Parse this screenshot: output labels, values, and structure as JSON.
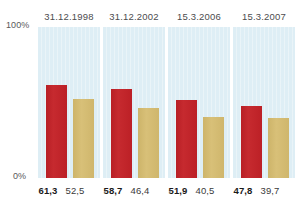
{
  "chart_data": {
    "type": "bar",
    "title": "",
    "subtitle": "",
    "xlabel": "",
    "ylabel": "",
    "ylim": [
      0,
      100
    ],
    "grid": false,
    "legend_position": "none",
    "axis_ticks": [
      "0%",
      "100%"
    ],
    "categories": [
      "31.12.1998",
      "31.12.2002",
      "15.3.2006",
      "15.3.2007"
    ],
    "series": [
      {
        "name": "primary",
        "color": "#c1272d",
        "values": [
          61.3,
          58.7,
          51.9,
          47.8
        ],
        "value_labels": [
          "61,3",
          "58,7",
          "51,9",
          "47,8"
        ]
      },
      {
        "name": "secondary",
        "color": "#d4bc72",
        "values": [
          52.5,
          46.4,
          40.5,
          39.7
        ],
        "value_labels": [
          "52,5",
          "46,4",
          "40,5",
          "39,7"
        ]
      }
    ],
    "panel_background": "#deeef5"
  },
  "axis": {
    "top_label": "100%",
    "bottom_label": "0%"
  },
  "groups": [
    {
      "date": "31.12.1998",
      "primary_value": "61,3",
      "secondary_value": "52,5",
      "primary_pct": 61.3,
      "secondary_pct": 52.5
    },
    {
      "date": "31.12.2002",
      "primary_value": "58,7",
      "secondary_value": "46,4",
      "primary_pct": 58.7,
      "secondary_pct": 46.4
    },
    {
      "date": "15.3.2006",
      "primary_value": "51,9",
      "secondary_value": "40,5",
      "primary_pct": 51.9,
      "secondary_pct": 40.5
    },
    {
      "date": "15.3.2007",
      "primary_value": "47,8",
      "secondary_value": "39,7",
      "primary_pct": 47.8,
      "secondary_pct": 39.7
    }
  ],
  "colors": {
    "primary_bar": "#c1272d",
    "secondary_bar": "#d4bc72",
    "panel": "#deeef5",
    "label_text": "#4c4c4e",
    "value_text": "#1a1a1a"
  }
}
